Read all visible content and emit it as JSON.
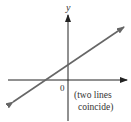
{
  "figure": {
    "type": "coordinate-graph",
    "axes": {
      "y_label": "y",
      "origin_label": "0"
    },
    "annotation": {
      "line1": "(two lines",
      "line2": "coincide)"
    },
    "lines": [
      {
        "name": "coinciding-lines",
        "slope_sign": "positive",
        "y_intercept_sign": "positive",
        "x_intercept_sign": "negative"
      }
    ],
    "colors": {
      "axis": "#222222",
      "line": "#666666",
      "text": "#333333"
    }
  }
}
